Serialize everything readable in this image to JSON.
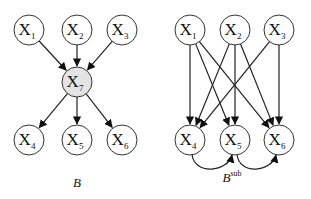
{
  "diagrams": [
    {
      "id": "B",
      "caption": "B",
      "nodes": [
        {
          "id": "X1",
          "label": "X",
          "sub": "1",
          "x": 29,
          "y": 30,
          "shaded": false
        },
        {
          "id": "X2",
          "label": "X",
          "sub": "2",
          "x": 77,
          "y": 30,
          "shaded": false
        },
        {
          "id": "X3",
          "label": "X",
          "sub": "3",
          "x": 122,
          "y": 30,
          "shaded": false
        },
        {
          "id": "X7",
          "label": "X",
          "sub": "7",
          "x": 77,
          "y": 82,
          "shaded": true
        },
        {
          "id": "X4",
          "label": "X",
          "sub": "4",
          "x": 29,
          "y": 140,
          "shaded": false
        },
        {
          "id": "X5",
          "label": "X",
          "sub": "5",
          "x": 77,
          "y": 140,
          "shaded": false
        },
        {
          "id": "X6",
          "label": "X",
          "sub": "6",
          "x": 122,
          "y": 140,
          "shaded": false
        }
      ],
      "edges": [
        [
          "X1",
          "X7"
        ],
        [
          "X2",
          "X7"
        ],
        [
          "X3",
          "X7"
        ],
        [
          "X7",
          "X4"
        ],
        [
          "X7",
          "X5"
        ],
        [
          "X7",
          "X6"
        ]
      ]
    },
    {
      "id": "Bsub",
      "caption": "B",
      "caption_sup": "sub",
      "nodes": [
        {
          "id": "X1",
          "label": "X",
          "sub": "1",
          "x": 190,
          "y": 30,
          "shaded": false
        },
        {
          "id": "X2",
          "label": "X",
          "sub": "2",
          "x": 235,
          "y": 30,
          "shaded": false
        },
        {
          "id": "X3",
          "label": "X",
          "sub": "3",
          "x": 279,
          "y": 30,
          "shaded": false
        },
        {
          "id": "X4",
          "label": "X",
          "sub": "4",
          "x": 190,
          "y": 140,
          "shaded": false
        },
        {
          "id": "X5",
          "label": "X",
          "sub": "5",
          "x": 235,
          "y": 140,
          "shaded": false
        },
        {
          "id": "X6",
          "label": "X",
          "sub": "6",
          "x": 279,
          "y": 140,
          "shaded": false
        }
      ],
      "edges": [
        [
          "X1",
          "X4"
        ],
        [
          "X1",
          "X5"
        ],
        [
          "X1",
          "X6"
        ],
        [
          "X2",
          "X4"
        ],
        [
          "X2",
          "X5"
        ],
        [
          "X2",
          "X6"
        ],
        [
          "X3",
          "X4"
        ],
        [
          "X3",
          "X6"
        ]
      ],
      "curved_edges": [
        [
          "X4",
          "X5"
        ],
        [
          "X5",
          "X6"
        ]
      ]
    }
  ]
}
